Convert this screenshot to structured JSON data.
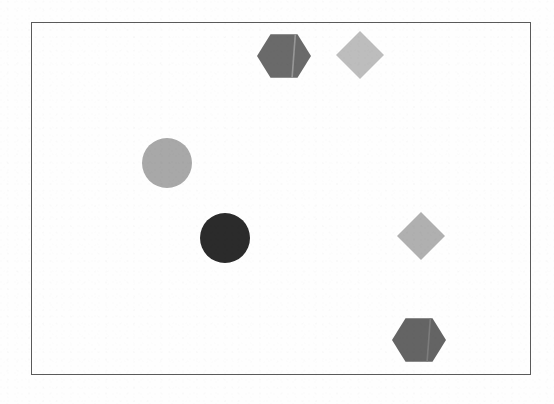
{
  "figure": {
    "title": "Geometric shapes on white background",
    "background_color": "#fefefe",
    "width": 554,
    "height": 404
  },
  "frame": {
    "name": "bounding-rectangle",
    "stroke_color": "#5a5a5a",
    "stroke_width": 1.5,
    "x": 31,
    "y": 22,
    "width": 500,
    "height": 353
  },
  "shapes": [
    {
      "id": "hexagon-dark-top",
      "type": "hexagon",
      "label": "Dark gray hexagon",
      "fill": "#6a6a6a",
      "seam_color": "#9a9a9a",
      "has_seam": true,
      "center_x": 284,
      "center_y": 56,
      "radius": 27,
      "rotation_deg": 0
    },
    {
      "id": "diamond-light-top",
      "type": "diamond",
      "label": "Light gray diamond",
      "fill": "#bdbdbd",
      "seam_color": "",
      "has_seam": false,
      "center_x": 360,
      "center_y": 55,
      "radius": 24,
      "rotation_deg": 45
    },
    {
      "id": "circle-light-left",
      "type": "circle",
      "label": "Medium gray circle",
      "fill": "#a8a8a8",
      "seam_color": "",
      "has_seam": false,
      "center_x": 167,
      "center_y": 163,
      "radius": 25,
      "rotation_deg": 0
    },
    {
      "id": "circle-dark-center",
      "type": "circle",
      "label": "Dark circle",
      "fill": "#2b2b2b",
      "seam_color": "",
      "has_seam": false,
      "center_x": 225,
      "center_y": 238,
      "radius": 25,
      "rotation_deg": 0
    },
    {
      "id": "diamond-light-right",
      "type": "diamond",
      "label": "Light gray diamond",
      "fill": "#b0b0b0",
      "seam_color": "",
      "has_seam": false,
      "center_x": 421,
      "center_y": 236,
      "radius": 24,
      "rotation_deg": 45
    },
    {
      "id": "hexagon-dark-bottom",
      "type": "hexagon",
      "label": "Dark gray hexagon",
      "fill": "#646464",
      "seam_color": "#7d7d7d",
      "has_seam": true,
      "center_x": 419,
      "center_y": 340,
      "radius": 27,
      "rotation_deg": 0
    }
  ],
  "counts": {
    "total_shapes": 6,
    "hexagons": 2,
    "diamonds": 2,
    "circles": 2
  }
}
